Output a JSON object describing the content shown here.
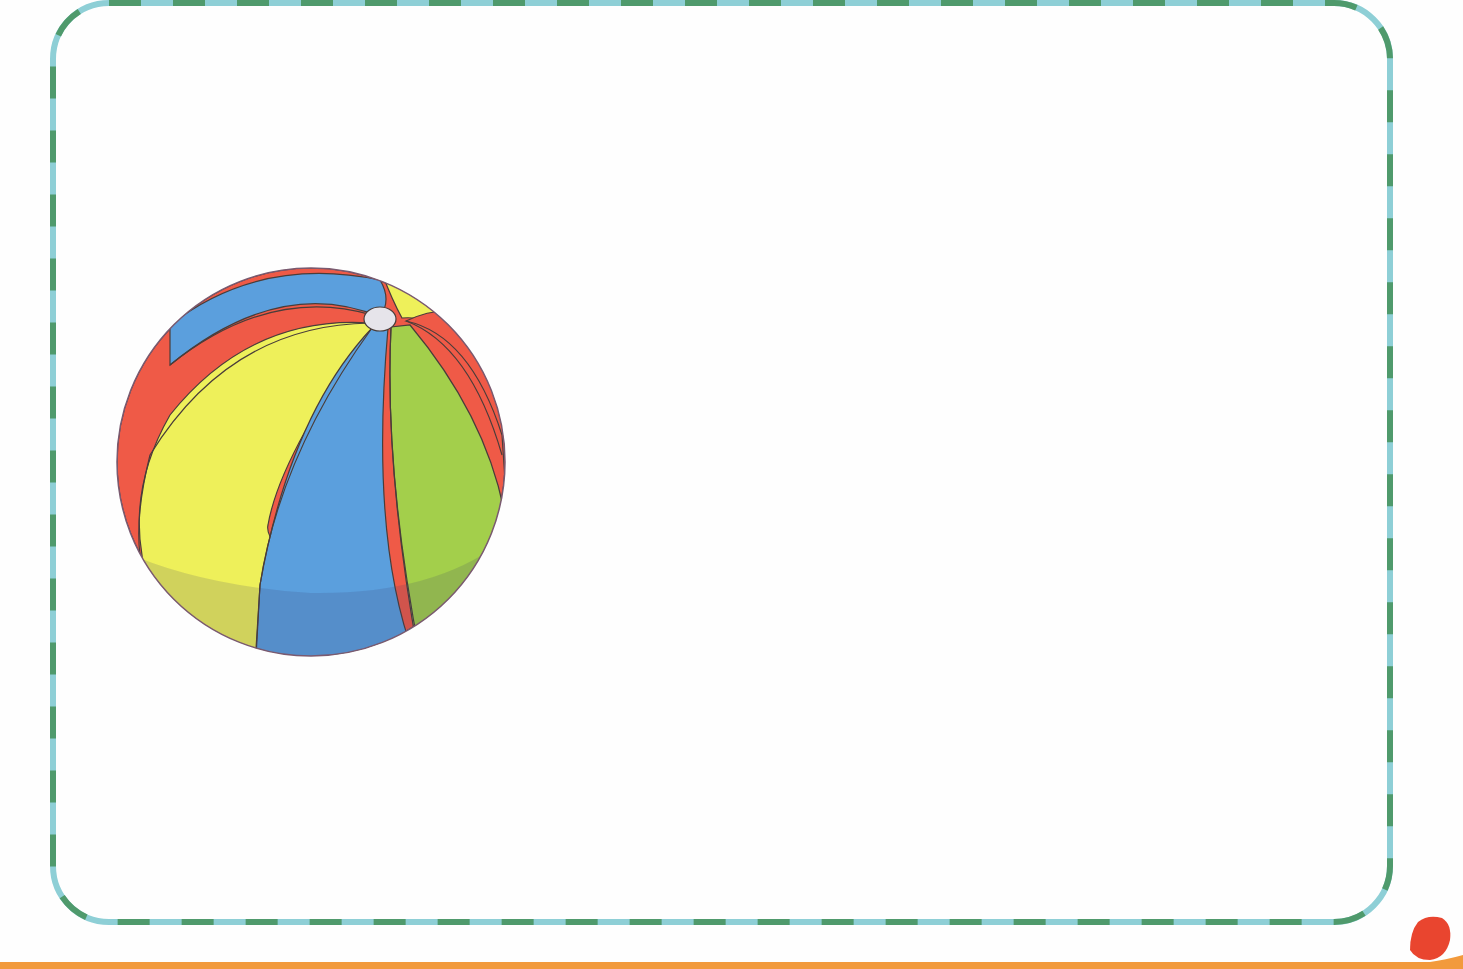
{
  "page": {
    "background_color": "#fefefe"
  },
  "frame": {
    "name": "dashed-rounded-frame",
    "dash_color_a": "#4f9a6c",
    "dash_color_b": "#8ecfd6",
    "stroke_width": 6,
    "corner_radius": 56
  },
  "illustration": {
    "label": "beach ball",
    "colors": {
      "red": "#ef5a47",
      "yellow": "#eef05a",
      "blue": "#5b9fdd",
      "green": "#a3cf4b",
      "cap": "#e6e4ea",
      "outline": "#4a3d3a"
    }
  },
  "decorations": {
    "bottom_strip_color": "#f29a3c",
    "corner_shape_color": "#e9452f"
  }
}
